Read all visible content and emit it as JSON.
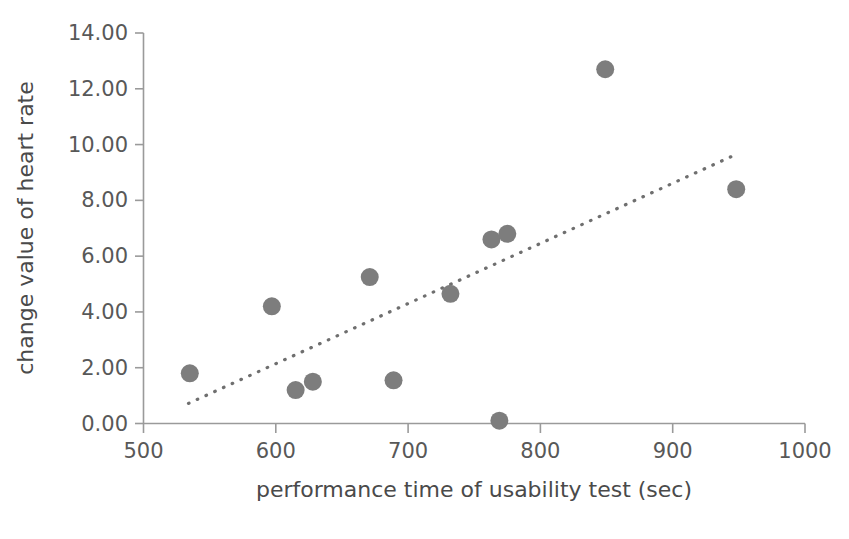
{
  "chart_data": {
    "type": "scatter",
    "title": "",
    "xlabel": "performance time of usability test (sec)",
    "ylabel": "change value of heart rate",
    "xlim": [
      500,
      1000
    ],
    "ylim": [
      0.0,
      14.0
    ],
    "xticks": [
      500,
      600,
      700,
      800,
      900,
      1000
    ],
    "yticks": [
      0.0,
      2.0,
      4.0,
      6.0,
      8.0,
      10.0,
      12.0,
      14.0
    ],
    "xtick_labels": [
      "500",
      "600",
      "700",
      "800",
      "900",
      "1000"
    ],
    "ytick_labels": [
      "0.00",
      "2.00",
      "4.00",
      "6.00",
      "8.00",
      "10.00",
      "12.00",
      "14.00"
    ],
    "grid": false,
    "legend": false,
    "marker_color": "#7d7d7d",
    "marker_radius": 9,
    "points": [
      {
        "x": 535,
        "y": 1.8
      },
      {
        "x": 597,
        "y": 4.2
      },
      {
        "x": 615,
        "y": 1.2
      },
      {
        "x": 628,
        "y": 1.5
      },
      {
        "x": 671,
        "y": 5.25
      },
      {
        "x": 689,
        "y": 1.55
      },
      {
        "x": 732,
        "y": 4.65
      },
      {
        "x": 763,
        "y": 6.6
      },
      {
        "x": 769,
        "y": 0.1
      },
      {
        "x": 775,
        "y": 6.8
      },
      {
        "x": 849,
        "y": 12.7
      },
      {
        "x": 948,
        "y": 8.4
      }
    ],
    "trendline": {
      "style": "dotted",
      "color": "#6f6f6f",
      "x_start": 534,
      "y_start": 0.72,
      "x_end": 949,
      "y_end": 9.67
    }
  },
  "axes": {
    "x_axis_label": "performance time of usability test (sec)",
    "y_axis_label": "change value of heart rate"
  }
}
